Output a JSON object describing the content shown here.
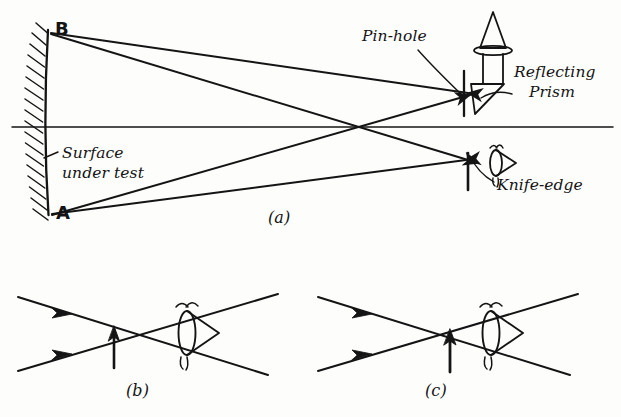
{
  "figure": {
    "background_color": "#fdfdfc",
    "ink_color": "#141414",
    "panels": [
      {
        "id": "a",
        "caption": "(a)",
        "description": "Knife-edge test layout: concave surface under test, pin-hole source with reflecting prism, knife-edge and observing eye"
      },
      {
        "id": "b",
        "caption": "(b)",
        "description": "Knife-edge positioned inside (before) the focal crossing point"
      },
      {
        "id": "c",
        "caption": "(c)",
        "description": "Knife-edge positioned outside (beyond) the focal crossing point"
      }
    ],
    "labels": {
      "pin_hole": "Pin-hole",
      "reflecting": "Reflecting",
      "prism": "Prism",
      "knife_edge": "Knife-edge",
      "surface_line1": "Surface",
      "surface_line2": "under test",
      "point_b": "B",
      "point_a": "A",
      "caption_a": "(a)",
      "caption_b": "(b)",
      "caption_c": "(c)"
    },
    "elements": {
      "mirror": "concave-mirror-hatched",
      "optical_axis": "horizontal-axis-line",
      "light_source": "lamp-with-condenser-lens",
      "prism_glyph": "right-angle-reflecting-prism",
      "pinhole_screen": "vertical-pinhole-bar",
      "knife_edge_bar": "vertical-knife-edge-bar",
      "eye": "observer-eye-symbol",
      "rays": "four-ray-bundle-to-and-from-mirror"
    }
  }
}
